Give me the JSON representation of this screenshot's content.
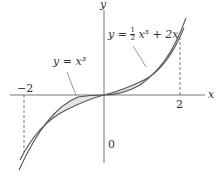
{
  "figure": {
    "axis_x_label": "x",
    "axis_y_label": "y",
    "origin_label": "0",
    "tick_neg": "−2",
    "tick_pos": "2",
    "curve1_label": "y = x³",
    "curve2_label_prefix": "y = ",
    "curve2_frac_num": "1",
    "curve2_frac_den": "2",
    "curve2_label_suffix": " x³ + 2x",
    "fill_color": "#e4e4e4",
    "curve_color": "#555555"
  }
}
